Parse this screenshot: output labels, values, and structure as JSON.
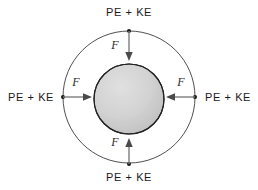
{
  "figure": {
    "title": "",
    "background_color": "#ffffff",
    "outer_circle": {
      "center_x": 129,
      "center_y": 97,
      "radius": 66,
      "stroke_color": "#3c3c3c"
    },
    "sphere": {
      "center_x": 129,
      "center_y": 99,
      "radius": 35,
      "fill_color": "#d3d3d3",
      "outline_color": "#2a2a2a",
      "shading_color": "#2e2e2e",
      "shading_position": "lower-right"
    },
    "arrow_color": "#7d7d7d",
    "arrowhead_color": "#4a4a4a"
  },
  "labels": {
    "energy": "PE + KE",
    "force": "F"
  },
  "annotations": [
    {
      "id": "top",
      "energy_label": "PE + KE",
      "force_label": "F",
      "direction": "down",
      "anchor_x": 129,
      "anchor_y": 31
    },
    {
      "id": "left",
      "energy_label": "PE + KE",
      "force_label": "F",
      "direction": "right",
      "anchor_x": 63,
      "anchor_y": 97
    },
    {
      "id": "right",
      "energy_label": "PE + KE",
      "force_label": "F",
      "direction": "left",
      "anchor_x": 195,
      "anchor_y": 97
    },
    {
      "id": "bottom",
      "energy_label": "PE + KE",
      "force_label": "F",
      "direction": "up",
      "anchor_x": 129,
      "anchor_y": 164
    }
  ]
}
